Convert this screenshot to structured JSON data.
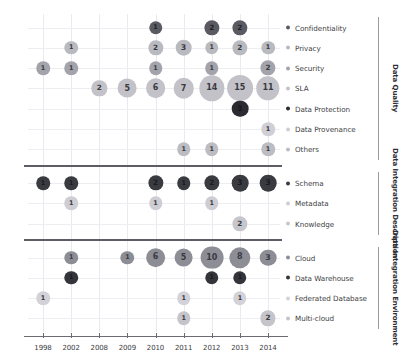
{
  "chart_data": {
    "type": "scatter",
    "title": "",
    "xlabel": "",
    "ylabel": "",
    "legend_position": "right",
    "grid": true,
    "x": [
      1998,
      2002,
      2008,
      2009,
      2010,
      2011,
      2012,
      2013,
      2014
    ],
    "x_tick_labels": [
      "1998",
      "2002",
      "2008",
      "2009",
      "2010",
      "2011",
      "2012",
      "2013",
      "2014"
    ],
    "groups": [
      {
        "name": "Data Quality",
        "categories": [
          {
            "label": "Confidentiality",
            "color": "#5a5a62",
            "points": [
              {
                "x": 2010,
                "value": 1
              },
              {
                "x": 2012,
                "value": 2
              },
              {
                "x": 2013,
                "value": 2
              }
            ]
          },
          {
            "label": "Privacy",
            "color": "#b9b9c0",
            "points": [
              {
                "x": 2002,
                "value": 1
              },
              {
                "x": 2010,
                "value": 2
              },
              {
                "x": 2011,
                "value": 3
              },
              {
                "x": 2012,
                "value": 1
              },
              {
                "x": 2013,
                "value": 2
              },
              {
                "x": 2014,
                "value": 1
              }
            ]
          },
          {
            "label": "Security",
            "color": "#a3a3ab",
            "points": [
              {
                "x": 1998,
                "value": 1
              },
              {
                "x": 2002,
                "value": 1
              },
              {
                "x": 2010,
                "value": 1
              },
              {
                "x": 2012,
                "value": 1
              },
              {
                "x": 2014,
                "value": 2
              }
            ]
          },
          {
            "label": "SLA",
            "color": "#c2c2c8",
            "points": [
              {
                "x": 2008,
                "value": 2
              },
              {
                "x": 2009,
                "value": 5
              },
              {
                "x": 2010,
                "value": 6
              },
              {
                "x": 2011,
                "value": 7
              },
              {
                "x": 2012,
                "value": 14
              },
              {
                "x": 2013,
                "value": 15
              },
              {
                "x": 2014,
                "value": 11
              }
            ]
          },
          {
            "label": "Data Protection",
            "color": "#2b2b31",
            "points": [
              {
                "x": 2013,
                "value": 3
              }
            ]
          },
          {
            "label": "Data Provenance",
            "color": "#cfcfd5",
            "points": [
              {
                "x": 2014,
                "value": 1
              }
            ]
          },
          {
            "label": "Others",
            "color": "#bcbcc3",
            "points": [
              {
                "x": 2011,
                "value": 1
              },
              {
                "x": 2012,
                "value": 1
              },
              {
                "x": 2014,
                "value": 1
              }
            ]
          }
        ]
      },
      {
        "name": "Data Integration Description",
        "categories": [
          {
            "label": "Schema",
            "color": "#3a3a41",
            "points": [
              {
                "x": 1998,
                "value": 1
              },
              {
                "x": 2002,
                "value": 1
              },
              {
                "x": 2010,
                "value": 2
              },
              {
                "x": 2011,
                "value": 1
              },
              {
                "x": 2012,
                "value": 2
              },
              {
                "x": 2013,
                "value": 3
              },
              {
                "x": 2014,
                "value": 3
              }
            ]
          },
          {
            "label": "Metadata",
            "color": "#cdcdd3",
            "points": [
              {
                "x": 2002,
                "value": 1
              },
              {
                "x": 2010,
                "value": 1
              },
              {
                "x": 2012,
                "value": 1
              }
            ]
          },
          {
            "label": "Knowledge",
            "color": "#c6c6cc",
            "points": [
              {
                "x": 2013,
                "value": 2
              }
            ]
          }
        ]
      },
      {
        "name": "Data Integration Environment",
        "categories": [
          {
            "label": "Cloud",
            "color": "#8d8d96",
            "points": [
              {
                "x": 2002,
                "value": 1
              },
              {
                "x": 2009,
                "value": 1
              },
              {
                "x": 2010,
                "value": 6
              },
              {
                "x": 2011,
                "value": 5
              },
              {
                "x": 2012,
                "value": 10
              },
              {
                "x": 2013,
                "value": 8
              },
              {
                "x": 2014,
                "value": 3
              }
            ]
          },
          {
            "label": "Data Warehouse",
            "color": "#34343b",
            "points": [
              {
                "x": 2002,
                "value": 1
              },
              {
                "x": 2012,
                "value": 1
              },
              {
                "x": 2013,
                "value": 1
              }
            ]
          },
          {
            "label": "Federated Database",
            "color": "#d2d2d8",
            "points": [
              {
                "x": 1998,
                "value": 1
              },
              {
                "x": 2011,
                "value": 1
              },
              {
                "x": 2013,
                "value": 1
              }
            ]
          },
          {
            "label": "Multi-cloud",
            "color": "#c4c4ca",
            "points": [
              {
                "x": 2011,
                "value": 1
              },
              {
                "x": 2014,
                "value": 2
              }
            ]
          }
        ]
      }
    ]
  }
}
